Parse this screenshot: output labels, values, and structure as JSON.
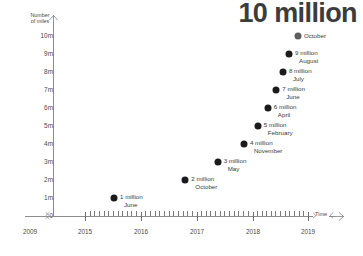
{
  "chart_data": {
    "type": "scatter",
    "title": "10 million",
    "xlabel": "Time",
    "ylabel": "Number\nof miles",
    "ytick_labels": [
      "10m",
      "9m",
      "8m",
      "7m",
      "6m",
      "5m",
      "4m",
      "3m",
      "2m",
      "1m",
      "0"
    ],
    "ytick_values": [
      10,
      9,
      8,
      7,
      6,
      5,
      4,
      3,
      2,
      1,
      0
    ],
    "ylim": [
      0,
      10
    ],
    "xtick_labels": [
      "2009",
      "2015",
      "2016",
      "2017",
      "2018",
      "2019"
    ],
    "xlim": [
      2015,
      2019
    ],
    "axis_break": true,
    "grid": false,
    "legend": "none",
    "minor_ticks": true,
    "categories": [
      "June 2015",
      "October 2016",
      "May 2017",
      "November 2017",
      "February 2018",
      "April 2018",
      "June 2018",
      "July 2018",
      "August 2018",
      "October 2018"
    ],
    "values": [
      1,
      2,
      3,
      4,
      5,
      6,
      7,
      8,
      9,
      10
    ],
    "points": [
      {
        "value_label": "1 million",
        "month": "June",
        "y": 1,
        "x": 2015.52,
        "muted": false
      },
      {
        "value_label": "2 million",
        "month": "October",
        "y": 2,
        "x": 2016.8,
        "muted": false
      },
      {
        "value_label": "3 million",
        "month": "May",
        "y": 3,
        "x": 2017.38,
        "muted": false
      },
      {
        "value_label": "4 million",
        "month": "November",
        "y": 4,
        "x": 2017.85,
        "muted": false
      },
      {
        "value_label": "5 million",
        "month": "February",
        "y": 5,
        "x": 2018.1,
        "muted": false
      },
      {
        "value_label": "6 million",
        "month": "April",
        "y": 6,
        "x": 2018.28,
        "muted": false
      },
      {
        "value_label": "7 million",
        "month": "June",
        "y": 7,
        "x": 2018.43,
        "muted": false
      },
      {
        "value_label": "8 million",
        "month": "July",
        "y": 8,
        "x": 2018.55,
        "muted": false
      },
      {
        "value_label": "9 million",
        "month": "August",
        "y": 9,
        "x": 2018.66,
        "muted": false
      },
      {
        "value_label": "",
        "month": "October",
        "y": 10,
        "x": 2018.82,
        "muted": true
      }
    ]
  },
  "colors": {
    "point": "#1b1b1b",
    "point_muted": "#5d5d5d",
    "axis": "#8d8d8d",
    "text": "#3a3a3a"
  }
}
